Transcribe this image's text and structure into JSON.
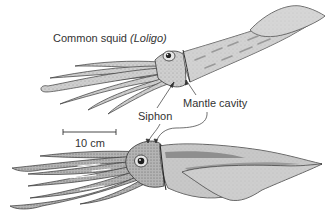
{
  "figure": {
    "title": "Common squid",
    "title_genus": "(Loligo)",
    "labels": {
      "siphon": "Siphon",
      "mantle_cavity": "Mantle cavity"
    },
    "scale_bar": {
      "label": "10 cm"
    },
    "colors": {
      "background": "#ffffff",
      "body_fill": "#c8c8c8",
      "body_fill_light": "#dcdcdc",
      "body_dark": "#8a8a8a",
      "outline": "#3a3a3a",
      "text": "#333333"
    },
    "illustrations": [
      {
        "name": "squid-top",
        "description": "Common squid, dorsal-lateral view, lighter shading"
      },
      {
        "name": "squid-bottom",
        "description": "Squid, lateral view, darker shading with fin"
      }
    ]
  }
}
